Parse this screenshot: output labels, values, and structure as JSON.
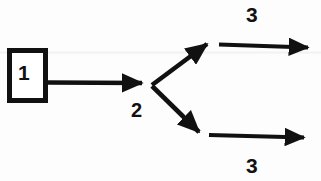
{
  "diagram": {
    "type": "flow-branch-diagram",
    "background_color": "#fdfdfd",
    "stroke_color": "#111111",
    "nodes": [
      {
        "id": "box-1",
        "shape": "rectangle",
        "label": "1",
        "x": 7,
        "y": 48,
        "width": 41,
        "height": 55,
        "border_width": 5
      },
      {
        "id": "node-2",
        "shape": "branch-point",
        "label": "2",
        "x": 152,
        "y": 84
      },
      {
        "id": "branch-top-3",
        "shape": "label-only",
        "label": "3",
        "x": 254,
        "y": 14
      },
      {
        "id": "branch-bottom-3",
        "shape": "label-only",
        "label": "3",
        "x": 254,
        "y": 165
      }
    ],
    "edges": [
      {
        "id": "edge-box1-to-node2",
        "from": "box-1",
        "to": "node-2",
        "direction": "right",
        "arrowhead": true
      },
      {
        "id": "edge-node2-to-upper",
        "from": "node-2",
        "to": "upper-branch",
        "direction": "up-right",
        "arrowhead": true
      },
      {
        "id": "edge-node2-to-lower",
        "from": "node-2",
        "to": "lower-branch",
        "direction": "down-right",
        "arrowhead": true
      },
      {
        "id": "edge-upper-out",
        "from": "upper-branch",
        "to": "branch-top-3",
        "direction": "right",
        "arrowhead": true
      },
      {
        "id": "edge-lower-out",
        "from": "lower-branch",
        "to": "branch-bottom-3",
        "direction": "right",
        "arrowhead": true
      }
    ],
    "faint_guideline": {
      "y": 52,
      "color": "#f1f1f1"
    }
  }
}
